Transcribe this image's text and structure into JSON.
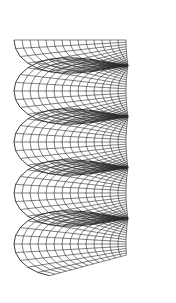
{
  "figure": {
    "stroke_color": "#2a2a2a",
    "background": "#ffffff",
    "axis_x": 128,
    "y_start": 40,
    "pitch": 51,
    "turns": 4.2,
    "inner_radius": 2,
    "outer_radius": 112,
    "depth_squash": 0.22,
    "radial_lines": 14,
    "angular_steps_per_turn": 24
  }
}
